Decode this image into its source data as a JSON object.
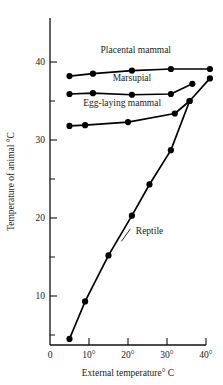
{
  "chart_data": {
    "type": "line",
    "title": "",
    "xlabel": "External temperature° C",
    "ylabel": "Temperature of animal °C",
    "xlim": [
      0,
      42
    ],
    "ylim": [
      0,
      44
    ],
    "grid": false,
    "legend_position": "inline-annotations",
    "x_ticks": [
      {
        "value": 0,
        "label": "0"
      },
      {
        "value": 10,
        "label": "10°"
      },
      {
        "value": 20,
        "label": "20°"
      },
      {
        "value": 30,
        "label": "30°"
      },
      {
        "value": 40,
        "label": "40°"
      }
    ],
    "y_ticks": [
      {
        "value": 10,
        "label": "10"
      },
      {
        "value": 20,
        "label": "20"
      },
      {
        "value": 30,
        "label": "30"
      },
      {
        "value": 40,
        "label": "40"
      }
    ],
    "y_minor_ticks": [
      5,
      15,
      25,
      35
    ],
    "series": [
      {
        "name": "Placental mammal",
        "label": "Placental mammal",
        "label_x": 22.0,
        "label_y": 41.2,
        "marker": "filled-circle",
        "points": [
          {
            "x": 5.0,
            "y": 38.2
          },
          {
            "x": 11.0,
            "y": 38.5
          },
          {
            "x": 21.0,
            "y": 38.9
          },
          {
            "x": 31.0,
            "y": 39.1
          },
          {
            "x": 41.0,
            "y": 39.1
          }
        ]
      },
      {
        "name": "Marsupial",
        "label": "Marsupial",
        "label_x": 21.0,
        "label_y": 37.6,
        "marker": "filled-circle",
        "points": [
          {
            "x": 5.0,
            "y": 35.9
          },
          {
            "x": 11.0,
            "y": 36.0
          },
          {
            "x": 21.0,
            "y": 35.8
          },
          {
            "x": 31.0,
            "y": 35.9
          },
          {
            "x": 36.5,
            "y": 37.2
          }
        ]
      },
      {
        "name": "Egg-laying mammal",
        "label": "Egg-laying mammal",
        "label_x": 18.5,
        "label_y": 34.4,
        "marker": "filled-circle",
        "points": [
          {
            "x": 5.0,
            "y": 31.8
          },
          {
            "x": 9.0,
            "y": 31.9
          },
          {
            "x": 20.0,
            "y": 32.3
          },
          {
            "x": 32.0,
            "y": 33.4
          },
          {
            "x": 35.8,
            "y": 35.0
          }
        ]
      },
      {
        "name": "Reptile",
        "label": "Reptile",
        "label_x": 22.0,
        "label_y": 18.0,
        "marker": "filled-circle",
        "leader": {
          "x1": 20.6,
          "y1": 18.6,
          "x2": 18.3,
          "y2": 17.0
        },
        "points": [
          {
            "x": 5.0,
            "y": 4.5
          },
          {
            "x": 9.0,
            "y": 9.3
          },
          {
            "x": 15.0,
            "y": 15.2
          },
          {
            "x": 21.0,
            "y": 20.3
          },
          {
            "x": 25.5,
            "y": 24.3
          },
          {
            "x": 31.0,
            "y": 28.7
          },
          {
            "x": 35.8,
            "y": 35.0
          },
          {
            "x": 41.0,
            "y": 37.9
          }
        ]
      }
    ]
  },
  "figure": {
    "axis_color": "#111111",
    "series_color": "#000000",
    "background": "#ffffff"
  }
}
